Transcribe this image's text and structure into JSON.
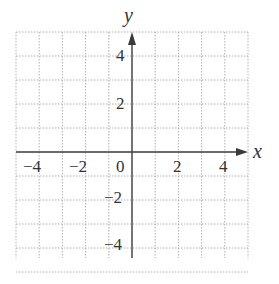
{
  "chart_data": {
    "type": "scatter",
    "title": "",
    "xlabel": "x",
    "ylabel": "y",
    "xlim": [
      -5,
      5
    ],
    "ylim": [
      -5,
      5
    ],
    "grid": true,
    "grid_style": "dotted",
    "grid_step": 1,
    "x_tick_labels": [
      "-4",
      "-2",
      "0",
      "2",
      "4"
    ],
    "x_ticks": [
      -4,
      -2,
      0,
      2,
      4
    ],
    "y_tick_labels": [
      "4",
      "2",
      "-2",
      "-4"
    ],
    "y_ticks": [
      4,
      2,
      -2,
      -4
    ],
    "series": []
  },
  "labels": {
    "x_axis": "x",
    "y_axis": "y",
    "origin": "0",
    "x_neg4": "−4",
    "x_neg2": "−2",
    "x_2": "2",
    "x_4": "4",
    "y_4": "4",
    "y_2": "2",
    "y_neg2": "−2",
    "y_neg4": "−4"
  }
}
